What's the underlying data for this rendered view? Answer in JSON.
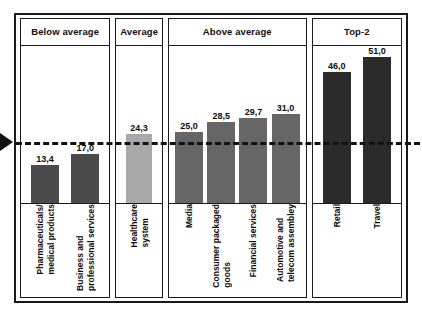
{
  "chart_data": {
    "type": "bar",
    "title": "",
    "xlabel": "",
    "ylabel": "",
    "ylim": [
      0,
      56
    ],
    "grid": false,
    "legend_position": "none",
    "reference_line": {
      "label": "Average",
      "value": 24.3,
      "style": "dashed",
      "color": "#121212",
      "marker": "left-triangle"
    },
    "value_format": "comma-decimal",
    "groups": [
      {
        "name": "Below average",
        "color": "#4a4a4a",
        "categories": [
          "Pharmaceuticals/\nmedical products",
          "Business and\nprofessional services"
        ],
        "values": [
          13.4,
          17.0
        ],
        "labels": [
          "13,4",
          "17,0"
        ]
      },
      {
        "name": "Average",
        "color": "#a8a8a8",
        "categories": [
          "Healthcare\nsystem"
        ],
        "values": [
          24.3
        ],
        "labels": [
          "24,3"
        ]
      },
      {
        "name": "Above average",
        "color": "#666666",
        "categories": [
          "Media",
          "Consumer packaged\ngoods",
          "Financial services",
          "Automotive and\ntelecom assembley"
        ],
        "values": [
          25.0,
          28.5,
          29.7,
          31.0
        ],
        "labels": [
          "25,0",
          "28,5",
          "29,7",
          "31,0"
        ]
      },
      {
        "name": "Top-2",
        "color": "#2b2b2b",
        "categories": [
          "Retail",
          "Travel"
        ],
        "values": [
          46.0,
          51.0
        ],
        "labels": [
          "46,0",
          "51,0"
        ]
      }
    ],
    "categories": [
      "Pharmaceuticals/medical products",
      "Business and professional services",
      "Healthcare system",
      "Media",
      "Consumer packaged goods",
      "Financial services",
      "Automotive and telecom assembley",
      "Retail",
      "Travel"
    ],
    "values": [
      13.4,
      17.0,
      24.3,
      25.0,
      28.5,
      29.7,
      31.0,
      46.0,
      51.0
    ]
  },
  "panels": [
    {
      "title": "Below average"
    },
    {
      "title": "Average"
    },
    {
      "title": "Above average"
    },
    {
      "title": "Top-2"
    }
  ]
}
